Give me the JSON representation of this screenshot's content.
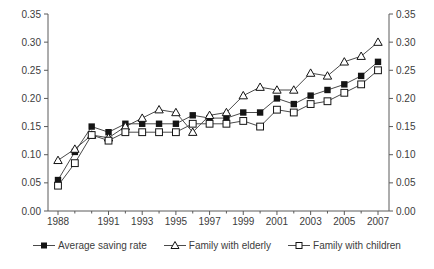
{
  "chart_data": {
    "type": "line",
    "title": "",
    "xlabel": "",
    "ylabel": "",
    "x": [
      1988,
      1989,
      1990,
      1991,
      1992,
      1993,
      1994,
      1995,
      1996,
      1997,
      1998,
      1999,
      2000,
      2001,
      2002,
      2003,
      2004,
      2005,
      2006,
      2007
    ],
    "x_tick_labels": [
      "1988",
      "1991",
      "1993",
      "1995",
      "1997",
      "1999",
      "2001",
      "2003",
      "2005",
      "2007"
    ],
    "x_labeled_years": [
      1988,
      1991,
      1993,
      1995,
      1997,
      1999,
      2001,
      2003,
      2005,
      2007
    ],
    "ylim": [
      0,
      0.35
    ],
    "y_ticks": [
      "0.00",
      "0.05",
      "0.10",
      "0.15",
      "0.20",
      "0.25",
      "0.30",
      "0.35"
    ],
    "grid": false,
    "legend_position": "bottom",
    "series": [
      {
        "name": "Average saving rate",
        "marker": "filled-square",
        "values": [
          0.055,
          0.105,
          0.15,
          0.14,
          0.155,
          0.155,
          0.155,
          0.155,
          0.17,
          0.165,
          0.165,
          0.175,
          0.175,
          0.2,
          0.19,
          0.205,
          0.215,
          0.225,
          0.24,
          0.265
        ]
      },
      {
        "name": "Family with elderly",
        "marker": "open-triangle",
        "values": [
          0.09,
          0.11,
          0.135,
          0.13,
          0.15,
          0.165,
          0.18,
          0.175,
          0.14,
          0.17,
          0.175,
          0.205,
          0.22,
          0.215,
          0.215,
          0.245,
          0.24,
          0.265,
          0.275,
          0.3
        ]
      },
      {
        "name": "Family with children",
        "marker": "open-square",
        "values": [
          0.045,
          0.085,
          0.135,
          0.125,
          0.14,
          0.14,
          0.14,
          0.14,
          0.155,
          0.155,
          0.155,
          0.16,
          0.15,
          0.18,
          0.175,
          0.19,
          0.195,
          0.21,
          0.225,
          0.25
        ]
      }
    ],
    "colors": {
      "line": "#4a4a4a",
      "axis": "#5a5a5a",
      "text": "#3c3c3c",
      "marker_fill": "#141414",
      "background": "#ffffff"
    }
  }
}
